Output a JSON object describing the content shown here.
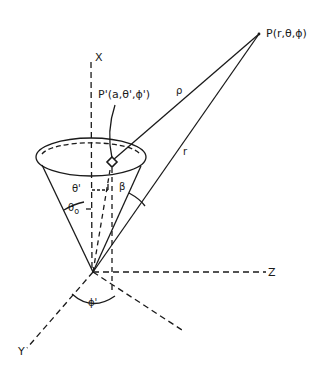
{
  "diagram": {
    "labels": {
      "x_axis": "X",
      "y_axis": "Y",
      "z_axis": "Z",
      "field_point": "P(r,θ,ϕ)",
      "source_point": "P'(a,θ',ϕ')",
      "rho": "ρ",
      "r": "r",
      "theta_prime": "θ'",
      "theta_0": "θ",
      "theta_0_sub": "o",
      "beta": "β",
      "phi_prime": "ϕ'"
    },
    "colors": {
      "ink": "#1a1a1a",
      "background": "#ffffff"
    }
  }
}
